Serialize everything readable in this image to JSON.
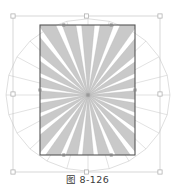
{
  "figure": {
    "caption": "图 8-126",
    "kind": "cad-line-drawing",
    "canvas": {
      "width": 175,
      "height": 195,
      "background": "#ffffff"
    },
    "colors": {
      "wedge_fill": "#c9c9c9",
      "wedge_stroke": "#b4b4b4",
      "rect_stroke": "#555555",
      "ray_stroke": "#bfbfbf",
      "outer_box_stroke": "#c6c6c6",
      "node_marker": "#8a8a8a",
      "handle_stroke": "#a8a8a8",
      "handle_fill": "#ffffff",
      "caption_text": "#3a3a3a"
    },
    "selection_box": {
      "x": 13,
      "y": 16,
      "width": 147,
      "height": 156
    },
    "inner_rect": {
      "x": 40,
      "y": 25,
      "width": 95,
      "height": 130
    },
    "center": {
      "x": 88,
      "y": 95
    },
    "ray_count": 24,
    "wedge_half_angle_deg": 5.2,
    "outer_radius": 82,
    "selection_handles": [
      {
        "name": "handle-top-left",
        "x": 13,
        "y": 16
      },
      {
        "name": "handle-top-center",
        "x": 86.5,
        "y": 16
      },
      {
        "name": "handle-top-right",
        "x": 160,
        "y": 16
      },
      {
        "name": "handle-middle-left",
        "x": 13,
        "y": 94
      },
      {
        "name": "handle-middle-right",
        "x": 160,
        "y": 94
      },
      {
        "name": "handle-bottom-left",
        "x": 13,
        "y": 172
      },
      {
        "name": "handle-bottom-center",
        "x": 86.5,
        "y": 172
      },
      {
        "name": "handle-bottom-right",
        "x": 160,
        "y": 172
      }
    ]
  }
}
